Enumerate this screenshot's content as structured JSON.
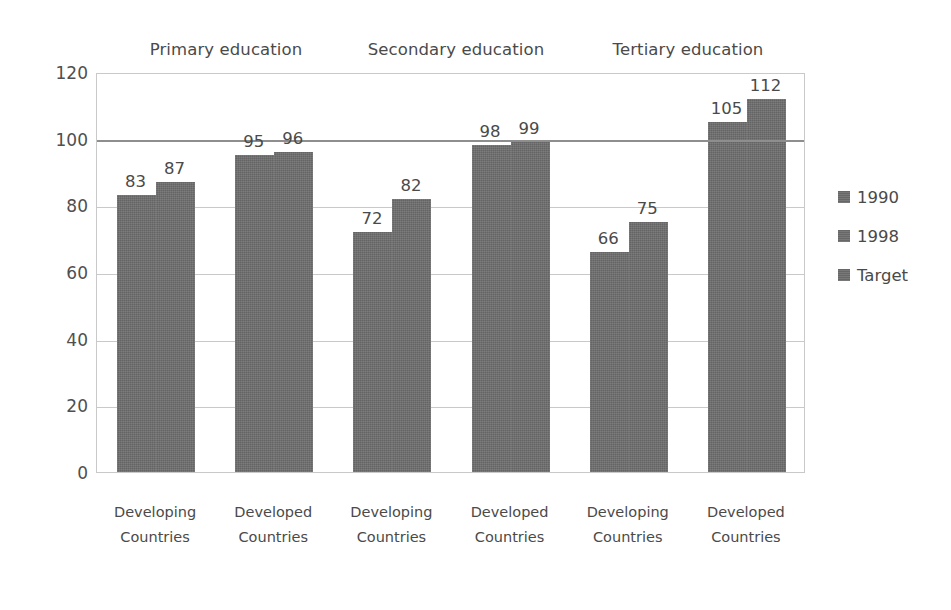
{
  "chart_data": {
    "type": "bar",
    "title": "",
    "subtitle": "",
    "xlabel": "",
    "ylabel": "",
    "ylim": [
      0,
      120
    ],
    "yticks": [
      0,
      20,
      40,
      60,
      80,
      100,
      120
    ],
    "grid": true,
    "legend_position": "right",
    "group_titles": [
      "Primary education",
      "Secondary education",
      "Tertiary education"
    ],
    "categories": [
      "Developing Countries",
      "Developed Countries",
      "Developing Countries",
      "Developed Countries",
      "Developing Countries",
      "Developed Countries"
    ],
    "category_lines": [
      [
        "Developing",
        "Countries"
      ],
      [
        "Developed",
        "Countries"
      ],
      [
        "Developing",
        "Countries"
      ],
      [
        "Developed",
        "Countries"
      ],
      [
        "Developing",
        "Countries"
      ],
      [
        "Developed",
        "Countries"
      ]
    ],
    "series": [
      {
        "name": "1990",
        "values": [
          83,
          95,
          72,
          98,
          66,
          105
        ]
      },
      {
        "name": "1998",
        "values": [
          87,
          96,
          82,
          99,
          75,
          112
        ]
      }
    ],
    "target": {
      "name": "Target",
      "value": 100,
      "style": "horizontal-line"
    },
    "legend": [
      "1990",
      "1998",
      "Target"
    ],
    "data_labels": [
      83,
      87,
      95,
      96,
      72,
      82,
      98,
      99,
      66,
      75,
      105,
      112
    ],
    "colors": {
      "bar": "#6d6d6d",
      "gridline": "#c9c9c9",
      "target_line": "#8e8e8e",
      "text": "#4a4a4a",
      "background": "#ffffff"
    }
  }
}
